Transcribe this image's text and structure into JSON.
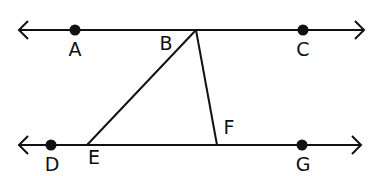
{
  "diagram": {
    "type": "geometry-parallel-lines-transversals",
    "colors": {
      "stroke": "#111111",
      "background": "#ffffff"
    },
    "lines": [
      {
        "name": "line-AC",
        "from": [
          19,
          30
        ],
        "to": [
          364,
          30
        ],
        "arrows": "both"
      },
      {
        "name": "line-DG",
        "from": [
          19,
          145
        ],
        "to": [
          361,
          145
        ],
        "arrows": "both"
      }
    ],
    "segments": [
      {
        "name": "segment-BE",
        "from": [
          196,
          30
        ],
        "to": [
          87,
          145
        ]
      },
      {
        "name": "segment-BF",
        "from": [
          196,
          30
        ],
        "to": [
          217,
          145
        ]
      }
    ],
    "points": [
      {
        "id": "A",
        "label": "A",
        "x": 75,
        "y": 30,
        "dot": true,
        "lx": 75,
        "ly": 56
      },
      {
        "id": "B",
        "label": "B",
        "x": 196,
        "y": 30,
        "dot": false,
        "lx": 166,
        "ly": 50
      },
      {
        "id": "C",
        "label": "C",
        "x": 303,
        "y": 30,
        "dot": true,
        "lx": 303,
        "ly": 56
      },
      {
        "id": "D",
        "label": "D",
        "x": 51,
        "y": 145,
        "dot": true,
        "lx": 52,
        "ly": 171
      },
      {
        "id": "E",
        "label": "E",
        "x": 87,
        "y": 145,
        "dot": false,
        "lx": 94,
        "ly": 164
      },
      {
        "id": "F",
        "label": "F",
        "x": 217,
        "y": 145,
        "dot": false,
        "lx": 229,
        "ly": 134
      },
      {
        "id": "G",
        "label": "G",
        "x": 302,
        "y": 145,
        "dot": true,
        "lx": 303,
        "ly": 171
      }
    ]
  }
}
